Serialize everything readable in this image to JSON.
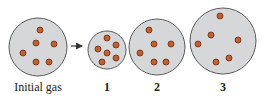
{
  "diagram": {
    "title": "",
    "colors": {
      "container_fill": "#d6d7d9",
      "container_stroke": "#5a5a5a",
      "particle_fill": "#c0602e",
      "particle_stroke": "#6b2a10",
      "arrow": "#333333",
      "text": "#222222"
    },
    "arrow": {
      "x1": 71,
      "y1": 46,
      "x2": 86,
      "y2": 46
    },
    "containers": [
      {
        "id": "initial",
        "label": "Initial gas",
        "label_bold": false,
        "cx": 38,
        "cy": 47,
        "r": 29,
        "particles": [
          {
            "x": 40,
            "y": 30
          },
          {
            "x": 36,
            "y": 43
          },
          {
            "x": 54,
            "y": 44
          },
          {
            "x": 23,
            "y": 53
          },
          {
            "x": 36,
            "y": 62
          },
          {
            "x": 49,
            "y": 62
          }
        ]
      },
      {
        "id": "1",
        "label": "1",
        "label_bold": true,
        "cx": 107,
        "cy": 50,
        "r": 19,
        "particles": [
          {
            "x": 107,
            "y": 38
          },
          {
            "x": 116,
            "y": 45
          },
          {
            "x": 98,
            "y": 49
          },
          {
            "x": 107,
            "y": 53
          },
          {
            "x": 116,
            "y": 58
          },
          {
            "x": 102,
            "y": 62
          }
        ]
      },
      {
        "id": "2",
        "label": "2",
        "label_bold": true,
        "cx": 157,
        "cy": 47,
        "r": 28,
        "particles": [
          {
            "x": 149,
            "y": 30
          },
          {
            "x": 154,
            "y": 44
          },
          {
            "x": 171,
            "y": 44
          },
          {
            "x": 140,
            "y": 53
          },
          {
            "x": 154,
            "y": 62
          },
          {
            "x": 166,
            "y": 62
          }
        ]
      },
      {
        "id": "3",
        "label": "3",
        "label_bold": true,
        "cx": 223,
        "cy": 41,
        "r": 33,
        "particles": [
          {
            "x": 220,
            "y": 16
          },
          {
            "x": 211,
            "y": 35
          },
          {
            "x": 238,
            "y": 40
          },
          {
            "x": 198,
            "y": 44
          },
          {
            "x": 229,
            "y": 58
          },
          {
            "x": 216,
            "y": 62
          }
        ]
      }
    ],
    "particle_radius": 3
  }
}
